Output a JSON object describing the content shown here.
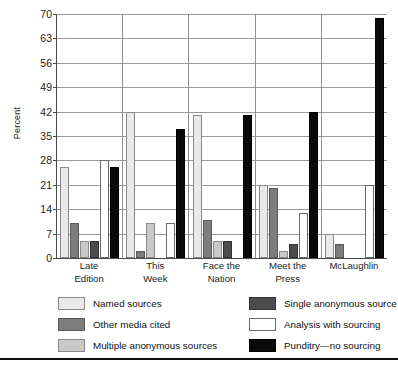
{
  "chart_data": {
    "type": "bar",
    "title": "",
    "xlabel": "",
    "ylabel": "Percent",
    "ylim": [
      0,
      70
    ],
    "yticks": [
      0,
      7,
      14,
      21,
      28,
      35,
      42,
      49,
      56,
      63,
      70
    ],
    "grid": true,
    "legend_position": "bottom",
    "categories": [
      "Late Edition",
      "This Week",
      "Face the Nation",
      "Meet the Press",
      "McLaughlin"
    ],
    "category_lines": [
      [
        "Late",
        "Edition"
      ],
      [
        "This",
        "Week"
      ],
      [
        "Face the",
        "Nation"
      ],
      [
        "Meet the",
        "Press"
      ],
      [
        "McLaughlin"
      ]
    ],
    "series": [
      {
        "name": "Named sources",
        "color": "#e9e9e9",
        "swatch_class": "sw-named",
        "values": [
          26,
          42,
          41,
          21,
          7
        ]
      },
      {
        "name": "Other media cited",
        "color": "#7d7d7d",
        "swatch_class": "sw-other",
        "values": [
          10,
          2,
          11,
          20,
          4
        ]
      },
      {
        "name": "Multiple anonymous sources",
        "color": "#c9c9c9",
        "swatch_class": "sw-multiple",
        "values": [
          5,
          10,
          5,
          2,
          0
        ]
      },
      {
        "name": "Single anonymous source",
        "color": "#4c4c4c",
        "swatch_class": "sw-single",
        "values": [
          5,
          0,
          5,
          4,
          0
        ]
      },
      {
        "name": "Analysis with sourcing",
        "color": "#ffffff",
        "swatch_class": "sw-analysis",
        "values": [
          28,
          10,
          0,
          13,
          21
        ]
      },
      {
        "name": "Punditry—no sourcing",
        "color": "#0a0a0a",
        "swatch_class": "sw-punditry",
        "values": [
          26,
          37,
          41,
          42,
          69
        ]
      }
    ]
  },
  "legend": {
    "left_column": [
      "Named sources",
      "Other media cited",
      "Multiple anonymous sources"
    ],
    "right_column": [
      "Single anonymous source",
      "Analysis with sourcing",
      "Punditry—no sourcing"
    ]
  }
}
